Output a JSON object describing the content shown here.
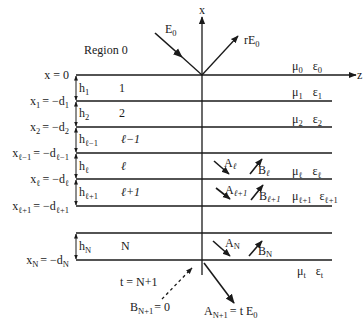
{
  "diagram": {
    "type": "multilayer-stratified-medium",
    "axes": {
      "vertical": "x",
      "horizontal": "z"
    },
    "region0_label": "Region 0",
    "incident_wave": {
      "label": "E",
      "sub": "0"
    },
    "reflected_wave": {
      "label": "rE",
      "sub": "0"
    },
    "transmitted_wave": {
      "label": "A",
      "sub": "N+1",
      "rhs": "= t E",
      "rhs_sub": "0"
    },
    "bottom_zero": {
      "label": "B",
      "sub": "N+1",
      "rhs": "= 0"
    },
    "transmitted_region_label": "t = N+1",
    "boundaries": [
      {
        "lhs": "x = 0",
        "sub": "",
        "rhs": ""
      },
      {
        "lhs": "x",
        "sub": "1",
        "rhs": "= −d",
        "rhs_sub": "1"
      },
      {
        "lhs": "x",
        "sub": "2",
        "rhs": "= −d",
        "rhs_sub": "2"
      },
      {
        "lhs": "x",
        "sub": "ℓ−1",
        "rhs": "= −d",
        "rhs_sub": "ℓ−1"
      },
      {
        "lhs": "x",
        "sub": "ℓ",
        "rhs": "= −d",
        "rhs_sub": "ℓ"
      },
      {
        "lhs": "x",
        "sub": "ℓ+1",
        "rhs": "= −d",
        "rhs_sub": "ℓ+1"
      },
      {
        "lhs": "x",
        "sub": "N",
        "rhs": "= −d",
        "rhs_sub": "N"
      }
    ],
    "layers": [
      {
        "h": "h",
        "h_sub": "1",
        "index": "1"
      },
      {
        "h": "h",
        "h_sub": "2",
        "index": "2"
      },
      {
        "h": "h",
        "h_sub": "ℓ−1",
        "index": "ℓ−1"
      },
      {
        "h": "h",
        "h_sub": "ℓ",
        "index": "ℓ"
      },
      {
        "h": "h",
        "h_sub": "ℓ+1",
        "index": "ℓ+1"
      },
      {
        "h": "h",
        "h_sub": "N",
        "index": "N"
      }
    ],
    "media": [
      {
        "mu": "μ",
        "mu_sub": "0",
        "eps": "ε",
        "eps_sub": "0"
      },
      {
        "mu": "μ",
        "mu_sub": "1",
        "eps": "ε",
        "eps_sub": "1"
      },
      {
        "mu": "μ",
        "mu_sub": "2",
        "eps": "ε",
        "eps_sub": "2"
      },
      {
        "mu": "μ",
        "mu_sub": "ℓ",
        "eps": "ε",
        "eps_sub": "ℓ"
      },
      {
        "mu": "μ",
        "mu_sub": "ℓ+1",
        "eps": "ε",
        "eps_sub": "ℓ+1"
      },
      {
        "mu": "μ",
        "mu_sub": "t",
        "eps": "ε",
        "eps_sub": "t"
      }
    ],
    "layer_waves": [
      {
        "a": "A",
        "a_sub": "ℓ",
        "b": "B",
        "b_sub": "ℓ"
      },
      {
        "a": "A",
        "a_sub": "ℓ+1",
        "b": "B",
        "b_sub": "ℓ+1"
      },
      {
        "a": "A",
        "a_sub": "N",
        "b": "B",
        "b_sub": "N"
      }
    ]
  }
}
